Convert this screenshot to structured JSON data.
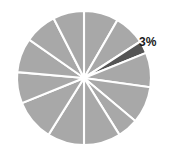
{
  "chart_data": {
    "type": "pie",
    "title": "",
    "subtitle": "",
    "xlabel": "",
    "ylabel": "",
    "grid": false,
    "legend": false,
    "legend_position": "none",
    "categories": [
      "Slice 1",
      "Slice 2",
      "Slice 3",
      "Slice 4",
      "Slice 5",
      "Slice 6",
      "Slice 7",
      "Slice 8",
      "Slice 9",
      "Slice 10",
      "Slice 11",
      "Slice 12"
    ],
    "values": [
      8.3,
      7.5,
      3,
      8.3,
      11.1,
      5,
      8.9,
      8.9,
      10,
      7.5,
      8.3,
      13.2
    ],
    "labels_shown": [
      "",
      "",
      "3%",
      "",
      "",
      "",
      "",
      "",
      "",
      "",
      "",
      ""
    ],
    "annotations": [
      {
        "text": "3%",
        "target_slice": "Slice 3",
        "x": 139,
        "y": 36
      }
    ],
    "colors": {
      "default_slice": "#a8a8a8",
      "highlight_slice": "#555555",
      "slice_border": "#ffffff",
      "background": "#ffffff",
      "label_text": "#1a1a1a"
    },
    "geometry": {
      "center_x": 84,
      "center_y": 78,
      "radius": 67,
      "start_angle_deg": 0,
      "direction": "clockwise"
    },
    "slice_boundaries_deg": [
      0,
      30,
      57,
      68,
      98,
      130,
      148,
      180,
      212,
      248,
      275,
      305,
      333,
      360
    ],
    "highlight_index": 2
  }
}
